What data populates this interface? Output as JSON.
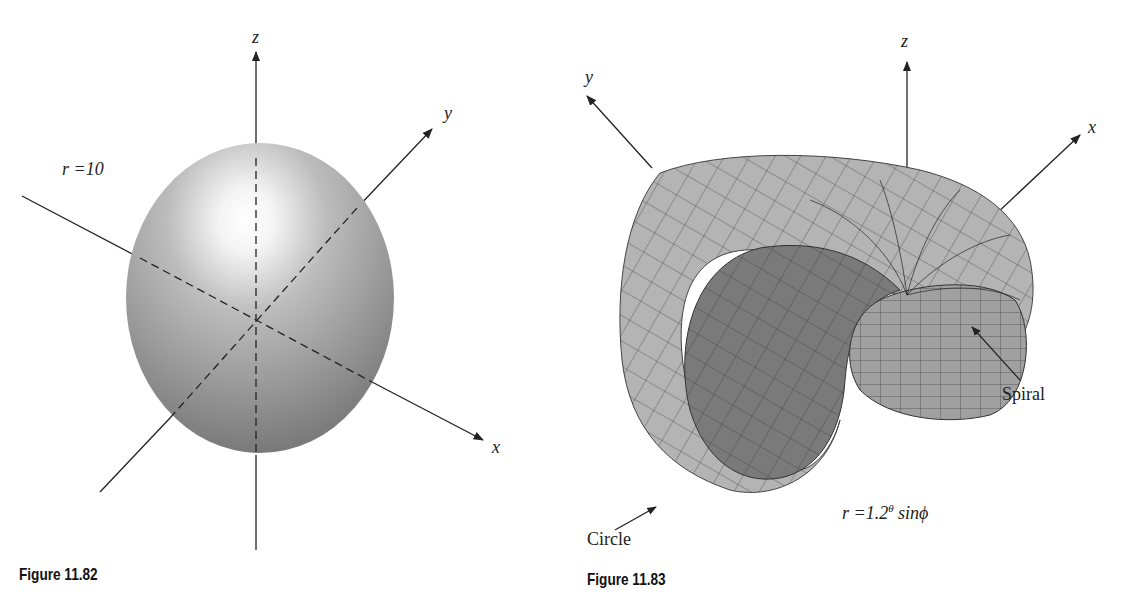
{
  "figures": [
    {
      "caption": "Figure 11.82",
      "surface": "sphere",
      "equation": "r =10",
      "axes": {
        "x": "x",
        "y": "y",
        "z": "z"
      }
    },
    {
      "caption": "Figure 11.83",
      "surface": "spiral shell",
      "equation": {
        "prefix": "r =1.2",
        "exponent": "θ",
        "suffix": " sinϕ"
      },
      "axes": {
        "x": "x",
        "y": "y",
        "z": "z"
      },
      "annotations": {
        "spiral": "Spiral",
        "circle": "Circle"
      }
    }
  ],
  "colors": {
    "axis": "#222222",
    "surface_light": "#bdbdbd",
    "surface_dark": "#6e6e6e",
    "grid": "#1a1a1a",
    "background": "#ffffff"
  }
}
